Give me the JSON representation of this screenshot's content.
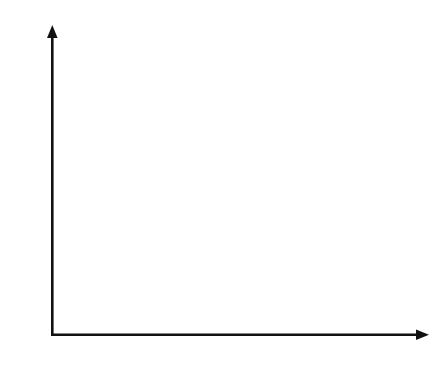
{
  "diagram": {
    "type": "coordinate-grid-dilation",
    "axes": {
      "x_label": "X",
      "y_label": "Y",
      "origin_label": "O",
      "x_cells": 15,
      "y_cells": 12
    },
    "triangles": [
      {
        "name": "ABC",
        "vertices": [
          {
            "label": "A",
            "x": 12,
            "y": 10
          },
          {
            "label": "B",
            "x": 10,
            "y": 6
          },
          {
            "label": "C",
            "x": 14,
            "y": 4
          }
        ]
      },
      {
        "name": "A'B'C'",
        "vertices": [
          {
            "label": "A′",
            "x": 6,
            "y": 5
          },
          {
            "label": "B′",
            "x": 5,
            "y": 3
          },
          {
            "label": "C′",
            "x": 7,
            "y": 2
          }
        ]
      }
    ],
    "colors": {
      "line": "#111111",
      "grid": "#2a2a2a",
      "background": "#ffffff"
    }
  }
}
